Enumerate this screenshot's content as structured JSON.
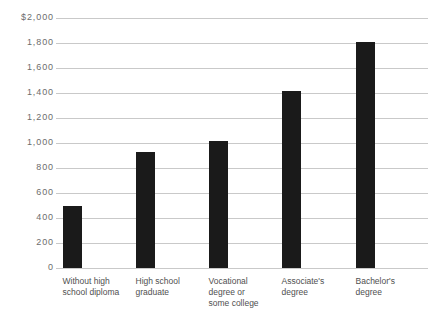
{
  "chart_data": {
    "type": "bar",
    "title": "",
    "subtitle": "",
    "xlabel": "",
    "ylabel": "",
    "ylim": [
      0,
      2000
    ],
    "grid": true,
    "legend": "none",
    "currency_symbol": "$",
    "categories": [
      "Without high\nschool diploma",
      "High school\ngraduate",
      "Vocational\ndegree or\nsome college",
      "Associate's\ndegree",
      "Bachelor's\ndegree"
    ],
    "values": [
      500,
      930,
      1015,
      1420,
      1810
    ],
    "ytick_values": [
      0,
      200,
      400,
      600,
      800,
      1000,
      1200,
      1400,
      1600,
      1800,
      2000
    ],
    "ytick_labels": [
      "0",
      "200",
      "400",
      "600",
      "800",
      "1,000",
      "1,200",
      "1,400",
      "1,600",
      "1,800",
      "$2,000"
    ],
    "colors": {
      "bar": "#1a1a1a",
      "gridline": "#c9c9c9",
      "tick_text": "#6d6d6d",
      "category_text": "#4f4f4f",
      "background": "#ffffff"
    }
  }
}
